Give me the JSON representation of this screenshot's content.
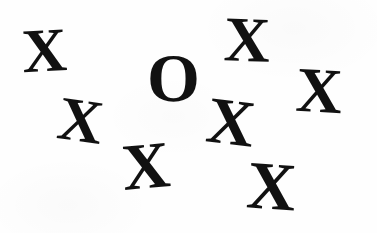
{
  "stimulus": {
    "title": "Visual search array",
    "background_color": "#fefefe",
    "glyph_color": "#111111",
    "width": 377,
    "height": 233,
    "target_letter": "O",
    "distractor_letter": "X",
    "target_count": 1,
    "distractor_count": 8,
    "total_items": 9,
    "items": [
      {
        "id": "x-top-left",
        "letter": "X",
        "role": "distractor",
        "x": 22,
        "y": 20,
        "size": 62,
        "rotation": -3
      },
      {
        "id": "x-top-right",
        "letter": "X",
        "role": "distractor",
        "x": 224,
        "y": 8,
        "size": 64,
        "rotation": 2
      },
      {
        "id": "o-target",
        "letter": "O",
        "role": "target",
        "x": 147,
        "y": 44,
        "size": 68,
        "rotation": 0
      },
      {
        "id": "x-far-right",
        "letter": "X",
        "role": "distractor",
        "x": 296,
        "y": 59,
        "size": 64,
        "rotation": 3
      },
      {
        "id": "x-left-middle",
        "letter": "X",
        "role": "distractor",
        "x": 58,
        "y": 90,
        "size": 62,
        "rotation": 8
      },
      {
        "id": "x-center-middle",
        "letter": "X",
        "role": "distractor",
        "x": 207,
        "y": 90,
        "size": 66,
        "rotation": 7
      },
      {
        "id": "x-bottom-center",
        "letter": "X",
        "role": "distractor",
        "x": 122,
        "y": 134,
        "size": 66,
        "rotation": -5
      },
      {
        "id": "x-bottom-right",
        "letter": "X",
        "role": "distractor",
        "x": 247,
        "y": 152,
        "size": 68,
        "rotation": 4
      }
    ]
  }
}
